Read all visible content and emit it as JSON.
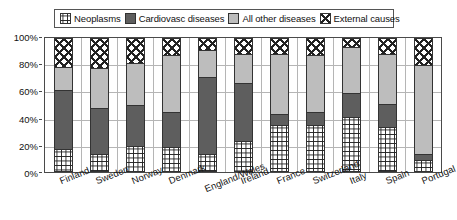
{
  "legend": {
    "entries": [
      {
        "label": "Neoplasms",
        "pattern": "grid-hatch",
        "color": "#ffffff"
      },
      {
        "label": "Cardiovasc diseases",
        "pattern": "solid-dark-gray",
        "color": "#5e5e5e"
      },
      {
        "label": "All other diseases",
        "pattern": "solid-light-gray",
        "color": "#bdbdbd"
      },
      {
        "label": "External causes",
        "pattern": "diagonal-cross",
        "color": "#ffffff"
      }
    ]
  },
  "yaxis": {
    "ticks": [
      "100%",
      "80%",
      "60%",
      "40%",
      "20%",
      "0%"
    ],
    "values": [
      100,
      80,
      60,
      40,
      20,
      0
    ]
  },
  "chart_data": {
    "type": "bar",
    "subtype": "stacked-percentage",
    "title": "",
    "xlabel": "",
    "ylabel": "",
    "ylim": [
      0,
      100
    ],
    "grid": true,
    "legend_position": "top",
    "categories": [
      "Finland",
      "Sweden",
      "Norway",
      "Denmark",
      "England/Wales",
      "Ireland",
      "France",
      "Switzerland",
      "Italy",
      "Spain",
      "Portugal"
    ],
    "series": [
      {
        "name": "Neoplasms",
        "values": [
          17,
          13,
          19,
          18,
          13,
          23,
          35,
          35,
          41,
          33,
          8
        ]
      },
      {
        "name": "Cardiovasc diseases",
        "values": [
          44,
          35,
          31,
          27,
          58,
          44,
          8,
          10,
          18,
          18,
          5
        ]
      },
      {
        "name": "All other diseases",
        "values": [
          18,
          30,
          32,
          43,
          21,
          22,
          46,
          43,
          35,
          38,
          67
        ]
      },
      {
        "name": "External causes",
        "values": [
          21,
          22,
          18,
          12,
          8,
          11,
          11,
          12,
          6,
          11,
          20
        ]
      }
    ]
  }
}
